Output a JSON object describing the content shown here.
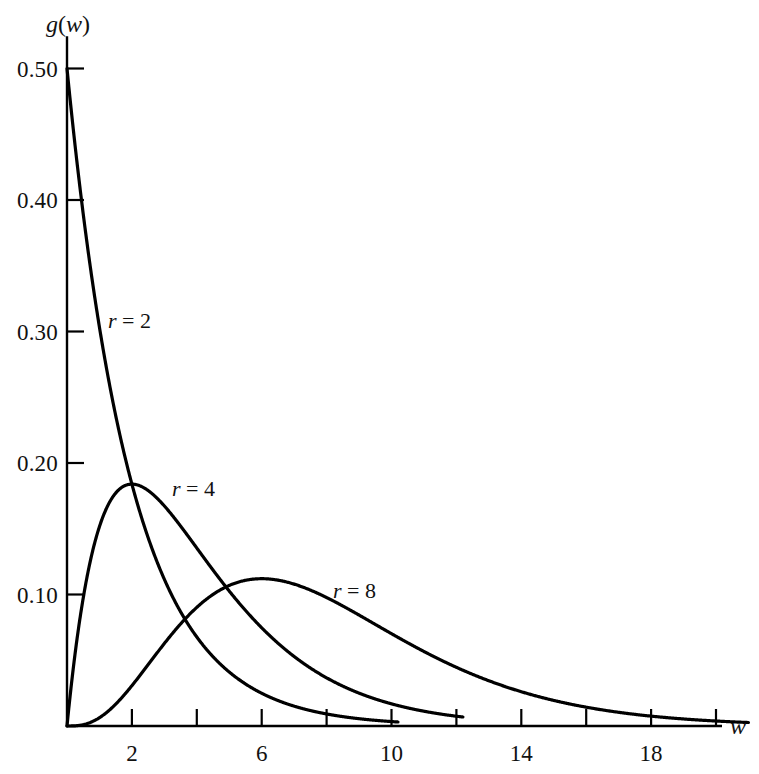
{
  "figure": {
    "background": "#ffffff",
    "ink_color": "#000000",
    "width": 759,
    "height": 774
  },
  "axes": {
    "y_title": "g(w)",
    "y_title_parts": {
      "g": "g",
      "open": "(",
      "w": "w",
      "close": ")"
    },
    "x_title": "w",
    "y_tick_labels": [
      "0.50",
      "0.40",
      "0.30",
      "0.20",
      "0.10"
    ],
    "y_tick_values": [
      0.5,
      0.4,
      0.3,
      0.2,
      0.1
    ],
    "x_tick_labels": [
      "2",
      "6",
      "10",
      "14",
      "18"
    ],
    "x_tick_values": [
      2,
      6,
      10,
      14,
      18
    ],
    "x_minor_ticks": [
      2,
      4,
      6,
      8,
      10,
      12,
      14,
      16,
      18,
      20
    ],
    "x_range": [
      0,
      21
    ],
    "y_range": [
      0,
      0.52
    ],
    "grid": false
  },
  "curve_labels": [
    {
      "name": "r-2-label",
      "r_symbol": "r",
      "equals": "=",
      "value": "2",
      "x": 108,
      "y": 310
    },
    {
      "name": "r-4-label",
      "r_symbol": "r",
      "equals": "=",
      "value": "4",
      "x": 172,
      "y": 478
    },
    {
      "name": "r-8-label",
      "r_symbol": "r",
      "equals": "=",
      "value": "8",
      "x": 333,
      "y": 580
    }
  ],
  "chart_data": {
    "type": "line",
    "title": "",
    "subtitle": "",
    "xlabel": "w",
    "ylabel": "g(w)",
    "xlim": [
      0,
      21
    ],
    "ylim": [
      0,
      0.52
    ],
    "grid": false,
    "legend_position": "inline-annotations",
    "x": [
      0,
      0.25,
      0.5,
      0.75,
      1,
      1.5,
      2,
      2.5,
      3,
      3.5,
      4,
      4.5,
      5,
      5.5,
      6,
      6.5,
      7,
      7.5,
      8,
      8.5,
      9,
      9.5,
      10,
      10.5,
      11,
      11.5,
      12,
      12.5,
      13,
      13.5,
      14,
      14.5,
      15,
      15.5,
      16,
      16.5,
      17,
      17.5,
      18,
      18.5,
      19,
      19.5,
      20,
      20.5,
      21
    ],
    "series": [
      {
        "name": "r = 2",
        "label": "r = 2",
        "r": 2,
        "x_end": 10.2,
        "peak": {
          "w": 0,
          "g": 0.5
        },
        "values": [
          0.5,
          0.4412,
          0.3894,
          0.3436,
          0.3033,
          0.2362,
          0.1839,
          0.1433,
          0.1116,
          0.0869,
          0.0677,
          0.0527,
          0.041,
          0.032,
          0.0249,
          0.0194,
          0.0151,
          0.0118,
          0.0092,
          0.0071,
          0.0056,
          0.0043,
          0.0034,
          0.0026,
          0.002,
          0.0016,
          0.0012,
          0.001,
          0.0008,
          0.0006,
          0.0005,
          0.0004,
          0.0003,
          0.0002,
          0.0002,
          0.0001,
          0.0001,
          0.0001,
          0.0001,
          0.0001,
          0,
          0,
          0,
          0,
          0
        ]
      },
      {
        "name": "r = 4",
        "label": "r = 4",
        "r": 4,
        "x_end": 12.2,
        "peak": {
          "w": 2,
          "g": 0.1839
        },
        "values": [
          0,
          0.0276,
          0.0487,
          0.0644,
          0.0758,
          0.0886,
          0.092,
          0.0896,
          0.0837,
          0.076,
          0.0677,
          0.0593,
          0.0513,
          0.044,
          0.0373,
          0.0315,
          0.0264,
          0.0221,
          0.0183,
          0.0151,
          0.0125,
          0.0103,
          0.0084,
          0.0069,
          0.0056,
          0.0045,
          0.0037,
          0.003,
          0.0024,
          0.0019,
          0.0016,
          0.0013,
          0.001,
          0.0008,
          0.0007,
          0.0005,
          0.0004,
          0.0003,
          0.0003,
          0.0002,
          0.0002,
          0.0001,
          0.0001,
          0.0001,
          0.0001
        ]
      },
      {
        "name": "r = 8",
        "label": "r = 8",
        "r": 8,
        "x_end": 21,
        "peak": {
          "w": 6,
          "g": 0.112
        },
        "values": [
          0,
          0.0,
          0.0003,
          0.001,
          0.0024,
          0.0066,
          0.0135,
          0.0227,
          0.0334,
          0.0448,
          0.0564,
          0.0674,
          0.0775,
          0.0862,
          0.0935,
          0.0992,
          0.1033,
          0.1059,
          0.1071,
          0.107,
          0.1058,
          0.1036,
          0.1005,
          0.0967,
          0.0923,
          0.0875,
          0.0823,
          0.077,
          0.0715,
          0.0661,
          0.0606,
          0.0553,
          0.0502,
          0.0453,
          0.0406,
          0.0363,
          0.0322,
          0.0285,
          0.0251,
          0.022,
          0.0192,
          0.0167,
          0.0145,
          0.0125,
          0.0107
        ]
      }
    ]
  }
}
